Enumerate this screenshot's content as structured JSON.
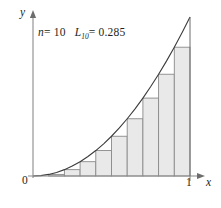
{
  "figure": {
    "title_annotation": {
      "n_label": "n",
      "n_equals": "= 10",
      "sum_label": "L",
      "sum_subscript": "10",
      "sum_equals": "= 0.285"
    },
    "axes": {
      "y_label": "y",
      "x_label": "x",
      "origin_label": "0",
      "x_tick_label": "1"
    },
    "colors": {
      "bar_fill": "#e9e9e9",
      "bar_stroke": "#8a8a8a",
      "curve_stroke": "#3b3b3b",
      "axis_stroke": "#8a8a8a",
      "text": "#231f20",
      "background": "#ffffff"
    }
  },
  "chart_data": {
    "type": "area",
    "title": "",
    "subtitle": "",
    "xlabel": "x",
    "ylabel": "y",
    "xlim": [
      0,
      1
    ],
    "ylim": [
      0,
      1
    ],
    "grid": false,
    "legend": "none",
    "annotations": [
      "n = 10",
      "L10 = 0.285"
    ],
    "xticks": [
      0,
      1
    ],
    "xticklabels": [
      "0",
      "1"
    ],
    "yticks": [],
    "yticklabels": [],
    "curve": {
      "name": "y = x^2",
      "x": [
        0.0,
        0.05,
        0.1,
        0.15,
        0.2,
        0.25,
        0.3,
        0.35,
        0.4,
        0.45,
        0.5,
        0.55,
        0.6,
        0.65,
        0.7,
        0.75,
        0.8,
        0.85,
        0.9,
        0.95,
        1.0
      ],
      "y": [
        0.0,
        0.0025,
        0.01,
        0.0225,
        0.04,
        0.0625,
        0.09,
        0.1225,
        0.16,
        0.2025,
        0.25,
        0.3025,
        0.36,
        0.4225,
        0.49,
        0.5625,
        0.64,
        0.7225,
        0.81,
        0.9025,
        1.0
      ]
    },
    "riemann": {
      "method": "left-endpoint",
      "n": 10,
      "sum": 0.285,
      "bar_left_edges": [
        0.0,
        0.1,
        0.2,
        0.3,
        0.4,
        0.5,
        0.6,
        0.7,
        0.8,
        0.9
      ],
      "bar_width": 0.1,
      "values": [
        0.0,
        0.01,
        0.04,
        0.09,
        0.16,
        0.25,
        0.36,
        0.49,
        0.64,
        0.81
      ]
    }
  }
}
